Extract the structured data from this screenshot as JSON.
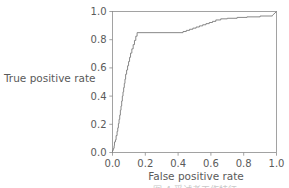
{
  "figure": {
    "background_color": "#ffffff",
    "curve_color": "#7a7a7a",
    "axis_color": "#8c8c8c",
    "text_color": "#5a5a5a"
  },
  "labels": {
    "y_axis": "True positive rate",
    "x_axis": "False positive rate",
    "cut_off_caption": "图 4  受试者工作特征"
  },
  "chart_data": {
    "type": "line",
    "title": "",
    "subtitle": "",
    "xlabel": "False positive rate",
    "ylabel": "True positive rate",
    "xlim": [
      0.0,
      1.0
    ],
    "ylim": [
      0.0,
      1.0
    ],
    "grid": false,
    "legend": null,
    "xticks": [
      0.0,
      0.2,
      0.4,
      0.6,
      0.8,
      1.0
    ],
    "xtick_labels": [
      "0.0",
      "0.2",
      "0.4",
      "0.6",
      "0.8",
      "1.0"
    ],
    "yticks": [
      0.0,
      0.2,
      0.4,
      0.6,
      0.8,
      1.0
    ],
    "ytick_labels": [
      "0.0",
      "0.2",
      "0.4",
      "0.6",
      "0.8",
      "1.0"
    ],
    "series": [
      {
        "name": "ROC curve",
        "drawstyle": "steps-post",
        "x": [
          0.0,
          0.0,
          0.005,
          0.005,
          0.01,
          0.01,
          0.012,
          0.012,
          0.018,
          0.018,
          0.022,
          0.022,
          0.028,
          0.028,
          0.032,
          0.032,
          0.036,
          0.036,
          0.04,
          0.04,
          0.044,
          0.044,
          0.048,
          0.048,
          0.052,
          0.052,
          0.056,
          0.056,
          0.06,
          0.06,
          0.064,
          0.064,
          0.068,
          0.068,
          0.072,
          0.072,
          0.076,
          0.076,
          0.08,
          0.08,
          0.086,
          0.086,
          0.092,
          0.092,
          0.098,
          0.098,
          0.104,
          0.104,
          0.11,
          0.11,
          0.118,
          0.118,
          0.126,
          0.126,
          0.134,
          0.134,
          0.142,
          0.142,
          0.15,
          0.15,
          0.43,
          0.43,
          0.45,
          0.45,
          0.47,
          0.47,
          0.49,
          0.49,
          0.51,
          0.51,
          0.53,
          0.53,
          0.55,
          0.55,
          0.57,
          0.57,
          0.59,
          0.59,
          0.61,
          0.61,
          0.63,
          0.63,
          0.66,
          0.66,
          0.7,
          0.7,
          0.76,
          0.76,
          0.82,
          0.82,
          0.9,
          0.9,
          0.975,
          0.975,
          1.0
        ],
        "y": [
          0.0,
          0.015,
          0.015,
          0.03,
          0.03,
          0.048,
          0.048,
          0.075,
          0.075,
          0.09,
          0.09,
          0.12,
          0.12,
          0.15,
          0.15,
          0.175,
          0.175,
          0.205,
          0.205,
          0.235,
          0.235,
          0.265,
          0.265,
          0.3,
          0.3,
          0.33,
          0.33,
          0.365,
          0.365,
          0.4,
          0.4,
          0.43,
          0.43,
          0.46,
          0.46,
          0.49,
          0.49,
          0.52,
          0.52,
          0.555,
          0.555,
          0.585,
          0.585,
          0.615,
          0.615,
          0.645,
          0.645,
          0.675,
          0.675,
          0.705,
          0.705,
          0.735,
          0.735,
          0.765,
          0.765,
          0.795,
          0.795,
          0.825,
          0.825,
          0.85,
          0.85,
          0.858,
          0.858,
          0.866,
          0.866,
          0.874,
          0.874,
          0.882,
          0.882,
          0.89,
          0.89,
          0.898,
          0.898,
          0.906,
          0.906,
          0.914,
          0.914,
          0.922,
          0.922,
          0.93,
          0.93,
          0.94,
          0.94,
          0.948,
          0.948,
          0.952,
          0.952,
          0.958,
          0.958,
          0.962,
          0.962,
          0.968,
          0.968,
          0.972,
          1.0
        ]
      }
    ]
  }
}
